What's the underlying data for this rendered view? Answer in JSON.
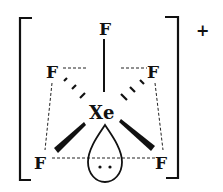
{
  "diagram": {
    "charge": "+",
    "central_atom": "Xe",
    "atoms": [
      {
        "id": "f_top",
        "label": "F"
      },
      {
        "id": "f_upper_left",
        "label": "F"
      },
      {
        "id": "f_upper_right",
        "label": "F"
      },
      {
        "id": "f_lower_left",
        "label": "F"
      },
      {
        "id": "f_lower_right",
        "label": "F"
      }
    ],
    "lone_pair": "..",
    "colors": {
      "ink": "#111111",
      "background": "#ffffff"
    }
  }
}
